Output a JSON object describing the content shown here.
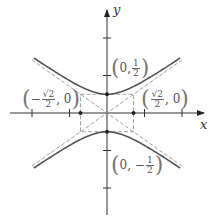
{
  "diagram": {
    "type": "hyperbola",
    "equation_form": "y^2/(1/4) - x^2/(1/2) = 1",
    "axes": {
      "x_label": "x",
      "y_label": "y"
    },
    "vertices": [
      {
        "label_pre": "0,",
        "num": "1",
        "den": "2",
        "sign": "",
        "x": 0,
        "y": 0.5
      },
      {
        "label_pre": "0,",
        "num": "1",
        "den": "2",
        "sign": "−",
        "x": 0,
        "y": -0.5
      }
    ],
    "co_vertices": [
      {
        "num": "√2",
        "den": "2",
        "sign": "",
        "post": ", 0",
        "x": 0.7071,
        "y": 0
      },
      {
        "num": "√2",
        "den": "2",
        "sign": "−",
        "post": ", 0",
        "x": -0.7071,
        "y": 0
      }
    ],
    "asymptotes": [
      "y = x/√2",
      "y = −x/√2"
    ],
    "ticks": {
      "x": [
        -2,
        -1,
        1,
        2
      ],
      "y": [
        -2,
        -1,
        1,
        2
      ]
    },
    "colors": {
      "curve": "#555555",
      "axis": "#333333",
      "dashed": "#888888",
      "label": "#666666"
    }
  },
  "labels": {
    "top_vertex": {
      "pre": "0, ",
      "num": "1",
      "den": "2"
    },
    "bottom_vertex": {
      "pre": "0, −",
      "num": "1",
      "den": "2"
    },
    "right_covertex": {
      "num": "√2",
      "den": "2",
      "post": ", 0"
    },
    "left_covertex": {
      "sign": "−",
      "num": "√2",
      "den": "2",
      "post": ", 0"
    },
    "x_axis": "x",
    "y_axis": "y"
  }
}
